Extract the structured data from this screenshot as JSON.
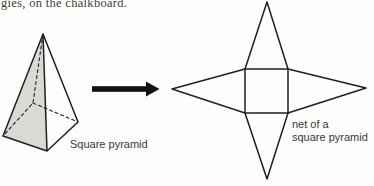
{
  "top_text": "gies, on the chalkboard.",
  "labels": {
    "pyramid_caption": "Square pyramid",
    "net_caption_line1": "net of a",
    "net_caption_line2": "square pyramid"
  },
  "icons": {
    "transform_arrow": "right-arrow"
  },
  "colors": {
    "background": "#fdfdfb",
    "line": "#1f1f1f",
    "pyramid_face_fill": "#d9d9d6",
    "arrow_fill": "#111111",
    "label_text": "#383838"
  }
}
